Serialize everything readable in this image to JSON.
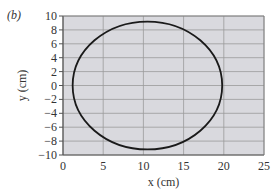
{
  "panel_label": "(b)",
  "chart_data": {
    "type": "line",
    "title": "",
    "xlabel": "x (cm)",
    "ylabel": "y (cm)",
    "xlim": [
      0,
      25
    ],
    "ylim": [
      -10,
      10
    ],
    "x_ticks": [
      0,
      5,
      10,
      15,
      20,
      25
    ],
    "y_ticks": [
      10,
      8,
      6,
      4,
      2,
      0,
      -2,
      -4,
      -6,
      -8,
      -10
    ],
    "x_tick_labels": [
      "0",
      "5",
      "10",
      "15",
      "20",
      "25"
    ],
    "y_tick_labels": [
      "10",
      "8",
      "6",
      "4",
      "2",
      "0",
      "−2",
      "−4",
      "−6",
      "−8",
      "−10"
    ],
    "grid": true,
    "series": [
      {
        "name": "ellipse",
        "shape": "ellipse",
        "center": [
          10.5,
          0
        ],
        "semi_axis_x": 9.3,
        "semi_axis_y": 9.2,
        "x_range": [
          1.2,
          19.8
        ],
        "y_range": [
          -9.2,
          9.2
        ],
        "color": "#1a1a1a"
      }
    ],
    "colors": {
      "plot_bg": "#d9d9de",
      "grid": "#9a9a9a",
      "curve": "#1a1a1a"
    }
  }
}
